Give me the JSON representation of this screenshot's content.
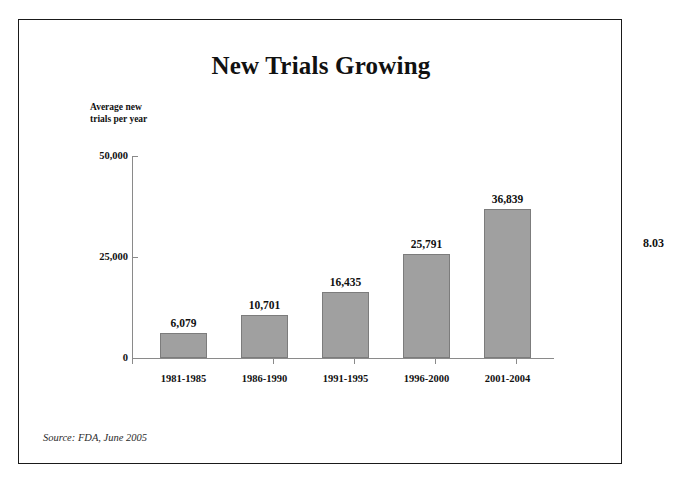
{
  "slide": {
    "number_label": "8.03",
    "source_note": "Source:  FDA, June 2005"
  },
  "chart_data": {
    "type": "bar",
    "title": "New Trials Growing",
    "xlabel": "",
    "ylabel": "Average new trials per year",
    "ylabel_line1": "Average new",
    "ylabel_line2": "trials per year",
    "categories": [
      "1981-1985",
      "1986-1990",
      "1991-1995",
      "1996-2000",
      "2001-2004"
    ],
    "values": [
      6079,
      10701,
      16435,
      25791,
      36839
    ],
    "value_labels": [
      "6,079",
      "10,701",
      "16,435",
      "25,791",
      "36,839"
    ],
    "ylim": [
      0,
      50000
    ],
    "ytick_values": [
      50000,
      25000,
      0
    ],
    "ytick_labels": [
      "50,000",
      "25,000",
      "0"
    ],
    "grid": false,
    "legend": false,
    "bar_color": "#a0a0a0",
    "bar_border_color": "#7c7c7c",
    "axis_color": "#8a8a8a",
    "text_color": "#111111"
  }
}
